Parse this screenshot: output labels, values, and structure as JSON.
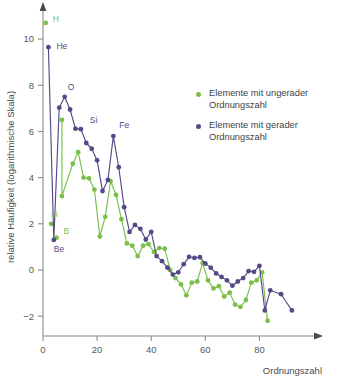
{
  "chart_data": {
    "type": "line",
    "title": "",
    "subtitle": "",
    "xlabel": "Ordnungszahl",
    "ylabel": "relative Häufigkeit (logarithmische Skala)",
    "xlim": [
      0,
      95
    ],
    "ylim": [
      -2.6,
      11.0
    ],
    "xticks": [
      0,
      20,
      40,
      60,
      80
    ],
    "xtick_labels": [
      "0",
      "20",
      "40",
      "60",
      "80"
    ],
    "yticks": [
      -2,
      0,
      2,
      4,
      6,
      8,
      10
    ],
    "ytick_labels": [
      "−2",
      "0",
      "2",
      "4",
      "6",
      "8",
      "10"
    ],
    "grid": false,
    "legend_position": "right",
    "legend": [
      {
        "name": "Elemente mit ungerader Ordnungszahl",
        "color": "#7bbf4a",
        "key": "odd"
      },
      {
        "name": "Elemente mit gerader Ordnungszahl",
        "color": "#554a86",
        "key": "even"
      }
    ],
    "annotations": [
      {
        "text": "H",
        "x": 1,
        "y": 10.7,
        "color": "#7bbf4a",
        "dx": 7,
        "dy": -1
      },
      {
        "text": "He",
        "x": 2,
        "y": 9.65,
        "color": "#554a86",
        "dx": 8,
        "dy": 2
      },
      {
        "text": "O",
        "x": 8,
        "y": 7.5,
        "color": "#554a86",
        "dx": 3,
        "dy": -7
      },
      {
        "text": "Si",
        "x": 14,
        "y": 6.1,
        "color": "#554a86",
        "dx": 9,
        "dy": -6
      },
      {
        "text": "Fe",
        "x": 26,
        "y": 5.8,
        "color": "#554a86",
        "dx": 6,
        "dy": -8
      },
      {
        "text": "Li",
        "x": 3,
        "y": 2.0,
        "color": "#7bbf4a",
        "dx": 0,
        "dy": -7
      },
      {
        "text": "Be",
        "x": 4,
        "y": 1.3,
        "color": "#554a86",
        "dx": 0,
        "dy": 12
      },
      {
        "text": "B",
        "x": 5,
        "y": 1.4,
        "color": "#7bbf4a",
        "dx": 7,
        "dy": -4
      }
    ],
    "series": [
      {
        "name": "Elemente mit ungerader Ordnungszahl",
        "key": "odd",
        "color": "#7bbf4a",
        "connected": false,
        "points": [
          {
            "x": 1,
            "y": 10.7
          },
          {
            "x": 3,
            "y": 2.0
          },
          {
            "x": 5,
            "y": 1.4
          }
        ]
      },
      {
        "name": "Elemente mit ungerader Ordnungszahl (Reihe)",
        "key": "odd_line",
        "color": "#7bbf4a",
        "connected": true,
        "points": [
          {
            "x": 7,
            "y": 6.5
          },
          {
            "x": 7,
            "y": 3.2
          },
          {
            "x": 11,
            "y": 4.6
          },
          {
            "x": 13,
            "y": 5.1
          },
          {
            "x": 15,
            "y": 4.0
          },
          {
            "x": 17,
            "y": 3.97
          },
          {
            "x": 19,
            "y": 3.48
          },
          {
            "x": 21,
            "y": 1.45
          },
          {
            "x": 23,
            "y": 2.3
          },
          {
            "x": 25,
            "y": 3.85
          },
          {
            "x": 27,
            "y": 3.25
          },
          {
            "x": 29,
            "y": 2.2
          },
          {
            "x": 31,
            "y": 1.15
          },
          {
            "x": 33,
            "y": 1.05
          },
          {
            "x": 35,
            "y": 0.6
          },
          {
            "x": 37,
            "y": 1.05
          },
          {
            "x": 39,
            "y": 1.12
          },
          {
            "x": 41,
            "y": 0.78
          },
          {
            "x": 43,
            "y": 0.95
          },
          {
            "x": 45,
            "y": 0.92
          },
          {
            "x": 47,
            "y": 0.0
          },
          {
            "x": 49,
            "y": -0.35
          },
          {
            "x": 51,
            "y": -0.62
          },
          {
            "x": 53,
            "y": -1.1
          },
          {
            "x": 55,
            "y": -0.55
          },
          {
            "x": 57,
            "y": -0.5
          },
          {
            "x": 59,
            "y": 0.3
          },
          {
            "x": 61,
            "y": -0.45
          },
          {
            "x": 63,
            "y": -0.8
          },
          {
            "x": 65,
            "y": -0.7
          },
          {
            "x": 67,
            "y": -1.15
          },
          {
            "x": 69,
            "y": -0.98
          },
          {
            "x": 71,
            "y": -1.5
          },
          {
            "x": 73,
            "y": -1.6
          },
          {
            "x": 75,
            "y": -1.3
          },
          {
            "x": 77,
            "y": -0.55
          },
          {
            "x": 79,
            "y": -0.45
          },
          {
            "x": 81,
            "y": -0.1
          },
          {
            "x": 83,
            "y": -2.2
          }
        ]
      },
      {
        "name": "Elemente mit gerader Ordnungszahl",
        "key": "even",
        "color": "#554a86",
        "connected": true,
        "points": [
          {
            "x": 2,
            "y": 9.65
          },
          {
            "x": 4,
            "y": 1.3
          },
          {
            "x": 6,
            "y": 7.03
          },
          {
            "x": 8,
            "y": 7.5
          },
          {
            "x": 10,
            "y": 6.95
          },
          {
            "x": 12,
            "y": 6.12
          },
          {
            "x": 14,
            "y": 6.1
          },
          {
            "x": 16,
            "y": 5.5
          },
          {
            "x": 18,
            "y": 5.25
          },
          {
            "x": 20,
            "y": 4.75
          },
          {
            "x": 22,
            "y": 3.42
          },
          {
            "x": 24,
            "y": 3.9
          },
          {
            "x": 26,
            "y": 5.8
          },
          {
            "x": 28,
            "y": 4.45
          },
          {
            "x": 30,
            "y": 2.72
          },
          {
            "x": 32,
            "y": 1.65
          },
          {
            "x": 34,
            "y": 1.95
          },
          {
            "x": 36,
            "y": 1.78
          },
          {
            "x": 38,
            "y": 1.32
          },
          {
            "x": 40,
            "y": 1.65
          },
          {
            "x": 42,
            "y": 0.6
          },
          {
            "x": 44,
            "y": 0.38
          },
          {
            "x": 46,
            "y": 0.1
          },
          {
            "x": 48,
            "y": -0.2
          },
          {
            "x": 50,
            "y": -0.1
          },
          {
            "x": 52,
            "y": 0.25
          },
          {
            "x": 54,
            "y": 0.57
          },
          {
            "x": 56,
            "y": 0.52
          },
          {
            "x": 58,
            "y": 0.55
          },
          {
            "x": 60,
            "y": 0.28
          },
          {
            "x": 62,
            "y": 0.1
          },
          {
            "x": 64,
            "y": -0.15
          },
          {
            "x": 66,
            "y": -0.3
          },
          {
            "x": 68,
            "y": -0.45
          },
          {
            "x": 70,
            "y": -0.68
          },
          {
            "x": 72,
            "y": -0.5
          },
          {
            "x": 74,
            "y": -0.35
          },
          {
            "x": 76,
            "y": -0.05
          },
          {
            "x": 78,
            "y": -0.08
          },
          {
            "x": 80,
            "y": 0.18
          },
          {
            "x": 82,
            "y": -1.75
          },
          {
            "x": 84,
            "y": -0.88
          },
          {
            "x": 88,
            "y": -1.05
          },
          {
            "x": 92,
            "y": -1.75
          }
        ]
      }
    ]
  }
}
